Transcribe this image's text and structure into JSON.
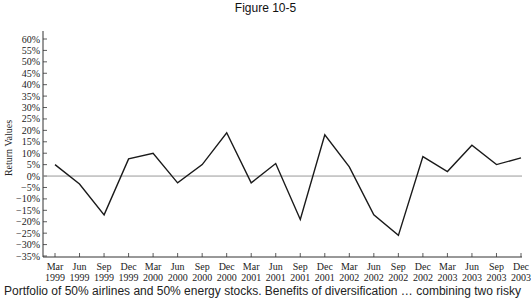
{
  "figure": {
    "title": "Figure 10-5",
    "caption": "Portfolio of 50% airlines and 50% energy stocks. Benefits of diversification … combining two risky"
  },
  "chart_data": {
    "type": "line",
    "title": "Figure 10-5",
    "xlabel": "",
    "ylabel": "Return Values",
    "ylim": [
      -35,
      60
    ],
    "yticks": [
      "60%",
      "55%",
      "50%",
      "45%",
      "40%",
      "35%",
      "30%",
      "25%",
      "20%",
      "15%",
      "10%",
      "5%",
      "0%",
      "-5%",
      "-10%",
      "-15%",
      "-20%",
      "-25%",
      "-30%",
      "-35%"
    ],
    "ytick_values": [
      60,
      55,
      50,
      45,
      40,
      35,
      30,
      25,
      20,
      15,
      10,
      5,
      0,
      -5,
      -10,
      -15,
      -20,
      -25,
      -30,
      -35
    ],
    "grid": false,
    "zero_line": true,
    "legend": null,
    "categories": [
      [
        "Mar",
        "1999"
      ],
      [
        "Jun",
        "1999"
      ],
      [
        "Sep",
        "1999"
      ],
      [
        "Dec",
        "1999"
      ],
      [
        "Mar",
        "2000"
      ],
      [
        "Jun",
        "2000"
      ],
      [
        "Sep",
        "2000"
      ],
      [
        "Dec",
        "2000"
      ],
      [
        "Mar",
        "2001"
      ],
      [
        "Jun",
        "2001"
      ],
      [
        "Sep",
        "2001"
      ],
      [
        "Dec",
        "2001"
      ],
      [
        "Mar",
        "2002"
      ],
      [
        "Jun",
        "2002"
      ],
      [
        "Sep",
        "2002"
      ],
      [
        "Dec",
        "2002"
      ],
      [
        "Mar",
        "2003"
      ],
      [
        "Jun",
        "2003"
      ],
      [
        "Sep",
        "2003"
      ],
      [
        "Dec",
        "2003"
      ]
    ],
    "series": [
      {
        "name": "50% airlines / 50% energy portfolio",
        "color": "#1a1a1a",
        "values": [
          5,
          -3.5,
          -17,
          7.5,
          10,
          -3,
          5,
          19,
          -3,
          5.5,
          -19,
          18,
          4,
          -17,
          -26,
          8.5,
          2,
          13.5,
          5,
          8
        ]
      }
    ]
  },
  "colors": {
    "line": "#1a1a1a",
    "zero_line": "#9a9a9a",
    "axis": "#333333"
  }
}
